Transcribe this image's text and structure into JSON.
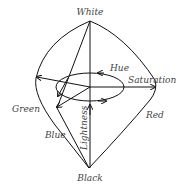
{
  "diagram": {
    "labels": {
      "white": "White",
      "black": "Black",
      "hue": "Hue",
      "saturation": "Saturation",
      "lightness": "Lightness",
      "green": "Green",
      "red": "Red",
      "blue": "Blue"
    },
    "colors": {
      "stroke": "#111111",
      "text": "#444444",
      "background": "#ffffff"
    }
  }
}
